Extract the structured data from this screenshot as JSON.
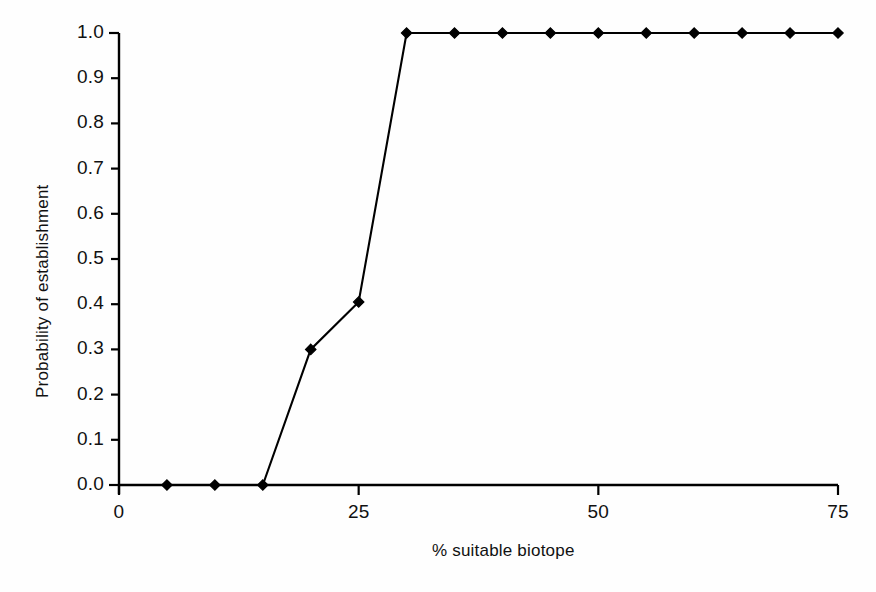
{
  "chart_data": {
    "type": "line",
    "title": "",
    "subtitle": "",
    "xlabel": "% suitable biotope",
    "ylabel": "Probability of establishment",
    "xlim": [
      0,
      75
    ],
    "ylim": [
      0.0,
      1.0
    ],
    "xticks": [
      0,
      25,
      50,
      75
    ],
    "xtick_labels": [
      "0",
      "25",
      "50",
      "75"
    ],
    "yticks": [
      0.0,
      0.1,
      0.2,
      0.3,
      0.4,
      0.5,
      0.6,
      0.7,
      0.8,
      0.9,
      1.0
    ],
    "ytick_labels": [
      "0.0",
      "0.1",
      "0.2",
      "0.3",
      "0.4",
      "0.5",
      "0.6",
      "0.7",
      "0.8",
      "0.9",
      "1.0"
    ],
    "grid": false,
    "legend": false,
    "legend_position": "none",
    "marker": "diamond",
    "line_color": "#000000",
    "marker_color": "#000000",
    "background_color": "#ffffff",
    "x": [
      5,
      10,
      15,
      20,
      25,
      30,
      35,
      40,
      45,
      50,
      55,
      60,
      65,
      70,
      75
    ],
    "values": [
      0.0,
      0.0,
      0.0,
      0.3,
      0.405,
      1.0,
      1.0,
      1.0,
      1.0,
      1.0,
      1.0,
      1.0,
      1.0,
      1.0,
      1.0
    ],
    "series": [
      {
        "name": "Probability of establishment",
        "x": [
          5,
          10,
          15,
          20,
          25,
          30,
          35,
          40,
          45,
          50,
          55,
          60,
          65,
          70,
          75
        ],
        "values": [
          0.0,
          0.0,
          0.0,
          0.3,
          0.405,
          1.0,
          1.0,
          1.0,
          1.0,
          1.0,
          1.0,
          1.0,
          1.0,
          1.0,
          1.0
        ]
      }
    ],
    "annotations": []
  }
}
